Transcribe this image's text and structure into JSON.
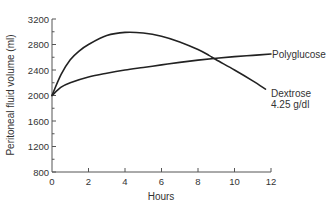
{
  "chart_data": {
    "type": "line",
    "title": "",
    "xlabel": "Hours",
    "ylabel": "Peritoneal fluid volume (ml)",
    "xlim": [
      0,
      12
    ],
    "ylim": [
      800,
      3200
    ],
    "x_ticks": [
      0,
      2,
      4,
      6,
      8,
      10,
      12
    ],
    "y_ticks": [
      800,
      1200,
      1600,
      2000,
      2400,
      2800,
      3200
    ],
    "y_minor_ticks": [
      1000,
      1400,
      1800,
      2200,
      2600,
      3000
    ],
    "grid": false,
    "legend_position": "inline-right",
    "series": [
      {
        "name": "Polyglucose",
        "label_lines": [
          "Polyglucose"
        ],
        "x": [
          0,
          0.5,
          1,
          2,
          3,
          4,
          5,
          6,
          7,
          8,
          9,
          10,
          11,
          12
        ],
        "values": [
          2000,
          2130,
          2200,
          2290,
          2350,
          2400,
          2440,
          2480,
          2520,
          2555,
          2585,
          2610,
          2630,
          2650
        ]
      },
      {
        "name": "Dextrose 4.25 g/dl",
        "label_lines": [
          "Dextrose",
          "4.25 g/dl"
        ],
        "x": [
          0,
          0.5,
          1,
          1.5,
          2,
          3,
          4,
          5,
          6,
          7,
          8,
          8.6,
          9,
          10,
          11,
          11.7
        ],
        "values": [
          2000,
          2330,
          2560,
          2700,
          2800,
          2940,
          2990,
          2980,
          2930,
          2840,
          2720,
          2630,
          2560,
          2400,
          2230,
          2100
        ]
      }
    ],
    "stroke_color": "#222222",
    "axis_color": "#555555"
  }
}
